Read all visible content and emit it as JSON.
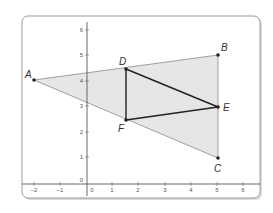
{
  "figure": {
    "type": "coordinate-plane-diagram",
    "x_axis": {
      "min": -2,
      "max": 6,
      "tick_labels": [
        "−2",
        "−1",
        "0",
        "1",
        "2",
        "3",
        "4",
        "5",
        "6"
      ]
    },
    "y_axis": {
      "min": 0,
      "max": 6,
      "tick_labels": [
        "0",
        "1",
        "2",
        "3",
        "4",
        "5",
        "6"
      ]
    },
    "points": [
      {
        "label": "A",
        "x": -2,
        "y": 4
      },
      {
        "label": "B",
        "x": 5,
        "y": 5
      },
      {
        "label": "C",
        "x": 5,
        "y": 1
      },
      {
        "label": "D",
        "x": 1.5,
        "y": 4.5
      },
      {
        "label": "E",
        "x": 5,
        "y": 3
      },
      {
        "label": "F",
        "x": 1.5,
        "y": 2.5
      }
    ],
    "shapes": [
      {
        "name": "triangle-ABC",
        "vertices": [
          "A",
          "B",
          "C"
        ],
        "fill": "#e6e6e6",
        "stroke": "#8a8a8a"
      },
      {
        "name": "triangle-DEF",
        "vertices": [
          "D",
          "E",
          "F"
        ],
        "fill": "none",
        "stroke": "#222222"
      }
    ],
    "colors": {
      "frame": "#9a9a9a",
      "axis": "#444444",
      "shaded": "#e6e6e6",
      "midsegment": "#222222"
    }
  },
  "labels": {
    "A": "A",
    "B": "B",
    "C": "C",
    "D": "D",
    "E": "E",
    "F": "F",
    "x_ticks": [
      "−2",
      "−1",
      "0",
      "1",
      "2",
      "3",
      "4",
      "5",
      "6"
    ],
    "y_ticks": [
      "0",
      "1",
      "2",
      "3",
      "4",
      "5",
      "6"
    ]
  }
}
